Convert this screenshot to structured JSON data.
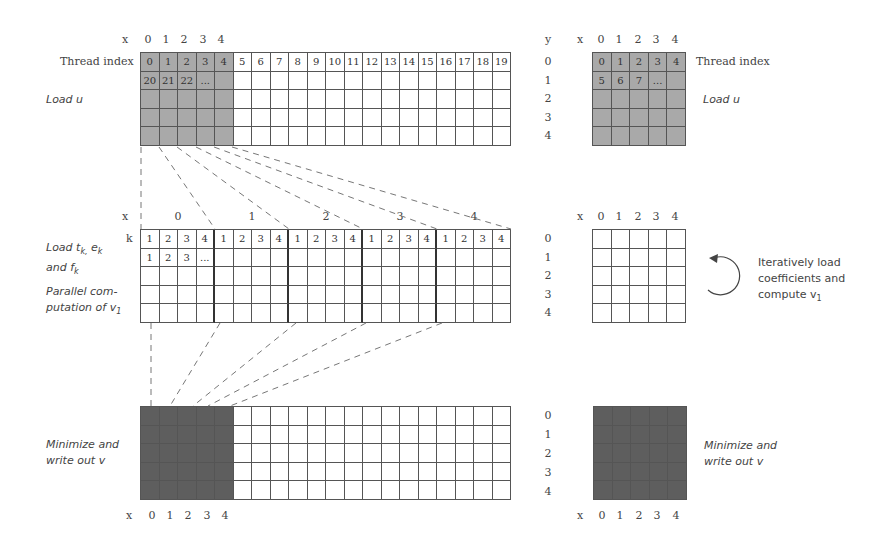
{
  "stage1": {
    "x_axis_label": "x",
    "x_ticks": [
      "0",
      "1",
      "2",
      "3",
      "4"
    ],
    "row_label": "Thread index",
    "left_caption": "Load u",
    "thread_row": [
      "0",
      "1",
      "2",
      "3",
      "4",
      "5",
      "6",
      "7",
      "8",
      "9",
      "10",
      "11",
      "12",
      "13",
      "14",
      "15",
      "16",
      "17",
      "18",
      "19"
    ],
    "second_row": [
      "20",
      "21",
      "22",
      "..."
    ],
    "right_y_label": "y",
    "right_x_label": "x",
    "right_x_ticks": [
      "0",
      "1",
      "2",
      "3",
      "4"
    ],
    "right_y_ticks": [
      "0",
      "1",
      "2",
      "3",
      "4"
    ],
    "right_thread_row": [
      "0",
      "1",
      "2",
      "3",
      "4"
    ],
    "right_second_row": [
      "5",
      "6",
      "7",
      "..."
    ],
    "right_row_label": "Thread index",
    "right_caption": "Load u"
  },
  "stage2": {
    "x_axis_label": "x",
    "group_labels": [
      "0",
      "1",
      "2",
      "3",
      "4"
    ],
    "k_label": "k",
    "k_row": [
      "1",
      "2",
      "3",
      "4",
      "1",
      "2",
      "3",
      "4",
      "1",
      "2",
      "3",
      "4",
      "1",
      "2",
      "3",
      "4",
      "1",
      "2",
      "3",
      "4"
    ],
    "second_row": [
      "1",
      "2",
      "3",
      "..."
    ],
    "caption_load": "Load t",
    "caption_load_sub1": "k,",
    "caption_load_e": " e",
    "caption_load_sub2": "k",
    "caption_and": "and f",
    "caption_and_sub": "k",
    "caption_parallel_1": "Parallel com-",
    "caption_parallel_2": "putation of v",
    "caption_parallel_sub": "1",
    "right_x_label": "x",
    "right_x_ticks": [
      "0",
      "1",
      "2",
      "3",
      "4"
    ],
    "right_y_ticks": [
      "0",
      "1",
      "2",
      "3",
      "4"
    ],
    "iter_line1": "Iteratively load",
    "iter_line2": "coefficients and",
    "iter_line3": "compute v",
    "iter_sub": "1",
    "loop_icon": "circular-arrow"
  },
  "stage3": {
    "caption_1": "Minimize and",
    "caption_2": "write out v",
    "x_axis_label": "x",
    "x_ticks": [
      "0",
      "1",
      "2",
      "3",
      "4"
    ],
    "right_y_ticks": [
      "0",
      "1",
      "2",
      "3",
      "4"
    ],
    "right_x_label": "x",
    "right_x_ticks": [
      "0",
      "1",
      "2",
      "3",
      "4"
    ],
    "right_caption_1": "Minimize and",
    "right_caption_2": "write out v"
  },
  "colors": {
    "light_shade": "#a9a9a9",
    "dark_shade": "#5e5e5e",
    "grid_line": "#555555",
    "dash_line": "#777777"
  }
}
